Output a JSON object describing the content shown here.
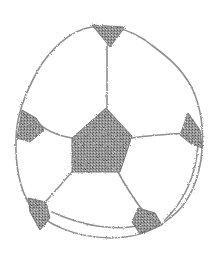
{
  "image": {
    "subject": "soccer ball pencil sketch",
    "background_color": "#ffffff",
    "line_color": "#8a8a8a",
    "fill_color": "#6e6e6e"
  }
}
